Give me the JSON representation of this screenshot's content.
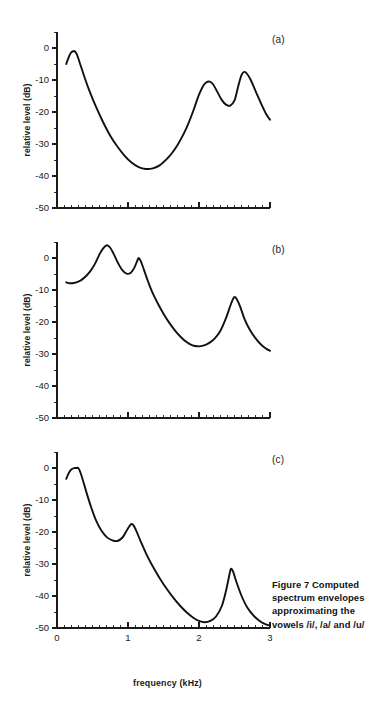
{
  "figure": {
    "caption_lines": [
      "Figure 7  Computed",
      "spectrum envelopes",
      "approximating the",
      "vowels /i/, /a/ and /u/"
    ],
    "caption_full": "Figure 7  Computed spectrum envelopes approximating the vowels /i/, /a/ and /u/",
    "xlabel": "frequency (kHz)",
    "ylabel": "relative level (dB)",
    "panel_tags": [
      "(a)",
      "(b)",
      "(c)"
    ]
  },
  "axes": {
    "x_ticks_major": [
      "0",
      "1",
      "2",
      "3"
    ],
    "x_tick_values": [
      0,
      1,
      2,
      3
    ],
    "y_ticks_major": [
      "0",
      "-10",
      "-20",
      "-30",
      "-40",
      "-50"
    ],
    "y_tick_values": [
      0,
      -10,
      -20,
      -30,
      -40,
      -50
    ],
    "xlim": [
      0,
      3
    ],
    "ylim": [
      -50,
      5
    ],
    "x_minor_step": 0.1,
    "y_minor_step": 5
  },
  "chart_data": {
    "type": "line",
    "title": "Figure 7  Computed spectrum envelopes approximating the vowels /i/, /a/ and /u/",
    "xlabel": "frequency (kHz)",
    "ylabel": "relative level (dB)",
    "xlim": [
      0,
      3
    ],
    "ylim": [
      -50,
      5
    ],
    "grid": false,
    "legend": "none",
    "panels": [
      {
        "tag": "(a)",
        "vowel": "/i/",
        "formant_peaks_khz": [
          0.25,
          2.15,
          2.6
        ],
        "formant_peak_levels_db": [
          -1.0,
          -10.5,
          -7.5
        ],
        "x": [
          0.13,
          0.17,
          0.2,
          0.23,
          0.25,
          0.28,
          0.32,
          0.38,
          0.45,
          0.55,
          0.65,
          0.75,
          0.85,
          0.95,
          1.05,
          1.15,
          1.25,
          1.35,
          1.45,
          1.55,
          1.62,
          1.7,
          1.78,
          1.85,
          1.92,
          2.0,
          2.06,
          2.1,
          2.15,
          2.2,
          2.26,
          2.32,
          2.38,
          2.44,
          2.5,
          2.55,
          2.6,
          2.65,
          2.72,
          2.8,
          2.88,
          2.95,
          3.0
        ],
        "y": [
          -5.0,
          -2.6,
          -1.4,
          -1.0,
          -1.0,
          -2.0,
          -4.6,
          -8.6,
          -13.0,
          -18.4,
          -23.2,
          -27.4,
          -30.8,
          -33.6,
          -35.8,
          -37.2,
          -37.8,
          -37.6,
          -36.6,
          -34.6,
          -32.8,
          -30.2,
          -27.0,
          -23.6,
          -19.6,
          -14.6,
          -11.8,
          -10.8,
          -10.5,
          -11.4,
          -13.8,
          -16.2,
          -17.7,
          -18.0,
          -16.4,
          -12.2,
          -8.4,
          -7.5,
          -9.6,
          -13.6,
          -17.6,
          -20.8,
          -22.4
        ]
      },
      {
        "tag": "(b)",
        "vowel": "/a/",
        "formant_peaks_khz": [
          0.7,
          1.15,
          2.5
        ],
        "formant_peak_levels_db": [
          4.0,
          0.0,
          -12.2
        ],
        "x": [
          0.13,
          0.18,
          0.24,
          0.3,
          0.36,
          0.42,
          0.48,
          0.54,
          0.6,
          0.65,
          0.7,
          0.75,
          0.8,
          0.86,
          0.92,
          0.98,
          1.04,
          1.09,
          1.13,
          1.15,
          1.18,
          1.22,
          1.28,
          1.34,
          1.42,
          1.5,
          1.58,
          1.66,
          1.74,
          1.82,
          1.9,
          1.98,
          2.06,
          2.14,
          2.22,
          2.3,
          2.38,
          2.44,
          2.48,
          2.5,
          2.53,
          2.58,
          2.64,
          2.72,
          2.8,
          2.88,
          2.95,
          3.0
        ],
        "y": [
          -7.6,
          -7.9,
          -7.8,
          -7.4,
          -6.6,
          -5.4,
          -3.8,
          -1.6,
          1.2,
          3.0,
          4.0,
          3.2,
          1.2,
          -1.6,
          -3.8,
          -4.9,
          -4.6,
          -3.0,
          -0.9,
          0.0,
          -1.0,
          -3.4,
          -7.2,
          -10.6,
          -14.2,
          -17.4,
          -20.2,
          -22.6,
          -24.6,
          -26.2,
          -27.2,
          -27.6,
          -27.4,
          -26.6,
          -25.2,
          -22.8,
          -18.8,
          -15.0,
          -12.8,
          -12.2,
          -12.8,
          -15.2,
          -19.0,
          -22.6,
          -25.2,
          -27.2,
          -28.4,
          -29.0
        ]
      },
      {
        "tag": "(c)",
        "vowel": "/u/",
        "formant_peaks_khz": [
          0.3,
          1.05,
          2.45
        ],
        "formant_peak_levels_db": [
          0.0,
          -17.5,
          -31.5
        ],
        "x": [
          0.13,
          0.17,
          0.21,
          0.25,
          0.28,
          0.3,
          0.33,
          0.37,
          0.42,
          0.48,
          0.55,
          0.62,
          0.7,
          0.78,
          0.85,
          0.92,
          0.98,
          1.02,
          1.05,
          1.08,
          1.12,
          1.18,
          1.26,
          1.34,
          1.44,
          1.54,
          1.64,
          1.74,
          1.84,
          1.92,
          2.0,
          2.08,
          2.16,
          2.24,
          2.32,
          2.38,
          2.43,
          2.45,
          2.48,
          2.53,
          2.6,
          2.68,
          2.78,
          2.88,
          2.96,
          3.0
        ],
        "y": [
          -3.4,
          -1.4,
          -0.3,
          0.0,
          0.0,
          0.0,
          -1.4,
          -4.2,
          -8.0,
          -12.2,
          -16.4,
          -19.4,
          -21.6,
          -22.6,
          -22.8,
          -21.8,
          -19.6,
          -18.2,
          -17.5,
          -18.0,
          -19.8,
          -23.0,
          -27.0,
          -30.4,
          -34.2,
          -37.6,
          -40.6,
          -43.2,
          -45.4,
          -46.8,
          -47.8,
          -48.2,
          -47.8,
          -46.4,
          -43.2,
          -38.4,
          -33.2,
          -31.5,
          -32.4,
          -35.8,
          -40.0,
          -43.6,
          -46.4,
          -48.2,
          -49.0,
          -49.2
        ]
      }
    ]
  }
}
